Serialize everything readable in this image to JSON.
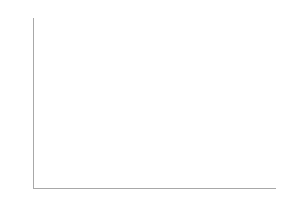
{
  "chart_data": {
    "type": "bar",
    "subtype": "stacked-vertical",
    "title": "",
    "xlabel": "",
    "ylabel": "",
    "categories": [
      "0-4",
      "5-14",
      "15-44",
      "25-44",
      "45-54",
      "65-74",
      "75+"
    ],
    "series": [
      {
        "name": "mammacarc.",
        "color": "#c6c6c6",
        "values": [
          0,
          0.5,
          2,
          5,
          29,
          60,
          55
        ]
      },
      {
        "name": "overige carc.",
        "color": "#0b0b0b",
        "values": [
          0,
          0.5,
          5,
          13,
          28,
          73,
          117
        ]
      }
    ],
    "totals": [
      0,
      1,
      7,
      18,
      57,
      133,
      172
    ],
    "ylim": [
      0,
      180
    ],
    "ytick_step": 20,
    "yticks": [
      0,
      20,
      40,
      60,
      80,
      100,
      120,
      140,
      160,
      180
    ],
    "ytick_labels": [
      "0",
      "20",
      "40",
      "60",
      "80",
      "100",
      "120",
      "140",
      "160",
      "180"
    ],
    "grid": true,
    "legend_position": "top-left",
    "stack_order_bottom_to_top": [
      "mammacarc.",
      "overige carc."
    ]
  },
  "legend": {
    "entries": [
      {
        "label": "overige carc.",
        "color": "#0b0b0b"
      },
      {
        "label": "mammacarc.",
        "color": "#c6c6c6"
      }
    ]
  }
}
